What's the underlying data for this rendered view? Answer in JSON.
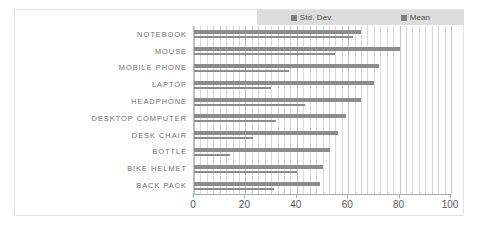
{
  "legend": {
    "entries": [
      {
        "label": "Std. Dev.",
        "color": "#808080",
        "icon": "square-marker-icon"
      },
      {
        "label": "Mean",
        "color": "#808080",
        "icon": "square-marker-icon"
      }
    ],
    "background": "#dcdcdc",
    "position": "top-right"
  },
  "axis": {
    "ticks": [
      "0",
      "20",
      "40",
      "60",
      "80",
      "100"
    ]
  },
  "chart_data": {
    "type": "bar",
    "orientation": "horizontal",
    "title": "",
    "xlabel": "",
    "ylabel": "",
    "xlim": [
      0,
      100
    ],
    "xticks": [
      0,
      20,
      40,
      60,
      80,
      100
    ],
    "grid": true,
    "legend_position": "top-right",
    "categories": [
      "NOTEBOOK",
      "MOUSE",
      "MOBILE PHONE",
      "LAPTOP",
      "HEADPHONE",
      "DESKTOP COMPUTER",
      "DESK CHAIR",
      "BOTTLE",
      "BIKE HELMET",
      "BACK PACK"
    ],
    "series": [
      {
        "name": "Mean",
        "color": "#8c8c8c",
        "values": [
          65,
          80,
          72,
          70,
          65,
          59,
          56,
          53,
          50,
          49
        ]
      },
      {
        "name": "Std. Dev.",
        "color": "#8c8c8c",
        "values": [
          62,
          55,
          37,
          30,
          43,
          32,
          23,
          14,
          40,
          31
        ]
      }
    ]
  }
}
